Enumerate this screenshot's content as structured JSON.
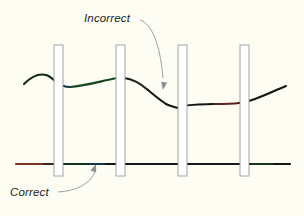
{
  "figure": {
    "background_color": "#fdfdf4",
    "width": 304,
    "height": 216
  },
  "annotations": {
    "incorrect": {
      "label": "Incorrect",
      "x": 84,
      "y": 22,
      "color": "#1c1c24"
    },
    "correct": {
      "label": "Correct",
      "x": 10,
      "y": 196,
      "color": "#1c1c24"
    }
  },
  "leader_lines": {
    "incorrect_arrow": {
      "path": "M 140 20 C 152 24 160 44 163 78",
      "arrow_tip_x": 163,
      "arrow_tip_y": 90,
      "color": "#8e8e96"
    },
    "correct_arrow": {
      "path": "M 58 192 C 76 191 90 184 95 172",
      "arrow_tip_x": 96,
      "arrow_tip_y": 164,
      "color": "#8e8e96"
    }
  },
  "plates": {
    "fill": "#ffffff",
    "stroke": "#9a9aa2",
    "stroke_width": 0.9,
    "items": [
      {
        "name": "plate-1",
        "x": 54,
        "y": 45,
        "width": 9,
        "height": 131
      },
      {
        "name": "plate-2",
        "x": 116,
        "y": 45,
        "width": 9,
        "height": 131
      },
      {
        "name": "plate-3",
        "x": 178,
        "y": 45,
        "width": 9,
        "height": 131
      },
      {
        "name": "plate-4",
        "x": 240,
        "y": 45,
        "width": 9,
        "height": 131
      }
    ]
  },
  "curves": {
    "incorrect_curve": {
      "name": "incorrect-curve",
      "description": "Wavy discontinuous curve passing through plates",
      "stroke_width": 2.1,
      "segments": [
        {
          "path": "M 24 84 C 31 77 38 73 46 75 C 50 76 53 79 56 82",
          "color": "#0f2a12"
        },
        {
          "path": "M 56 82 C 60 85 64 87 70 87",
          "color": "#12314a"
        },
        {
          "path": "M 70 87 C 84 86 98 82 112 79 C 116 78 120 78 124 78",
          "color": "#17451f"
        },
        {
          "path": "M 124 78 C 132 79 140 83 148 90",
          "color": "#12231c"
        },
        {
          "path": "M 148 90 C 155 96 160 100 166 104",
          "color": "#1a1a1a"
        },
        {
          "path": "M 166 104 C 170 106 174 107 178 108",
          "color": "#161616"
        },
        {
          "path": "M 181 106 C 190 105 200 104 214 104",
          "color": "#161616"
        },
        {
          "path": "M 214 104 C 224 104 232 104 239 103",
          "color": "#5a241c"
        },
        {
          "path": "M 239 103 C 246 102 250 101 255 99",
          "color": "#241414"
        },
        {
          "path": "M 255 99 C 266 95 276 90 286 86",
          "color": "#151515"
        }
      ]
    },
    "correct_line": {
      "name": "correct-line",
      "description": "Straight horizontal baseline spanning full width",
      "y": 164,
      "stroke_width": 2.1,
      "segments": [
        {
          "path": "M 16 164 L 44 164",
          "color": "#7a3322"
        },
        {
          "path": "M 44 164 L 62 164",
          "color": "#3a2420"
        },
        {
          "path": "M 62 164 L 90 164",
          "color": "#14301e"
        },
        {
          "path": "M 90 164 L 106 164",
          "color": "#12394a"
        },
        {
          "path": "M 106 164 L 186 164",
          "color": "#151515"
        },
        {
          "path": "M 186 164 L 252 164",
          "color": "#181818"
        },
        {
          "path": "M 252 164 L 274 164",
          "color": "#17381f"
        },
        {
          "path": "M 274 164 L 290 164",
          "color": "#151515"
        }
      ]
    }
  }
}
